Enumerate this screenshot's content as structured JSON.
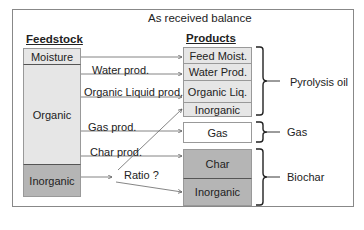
{
  "title": "As received balance",
  "feedstock": {
    "header": "Feedstock",
    "segments": [
      {
        "label": "Moisture",
        "shade": "light"
      },
      {
        "label": "Organic",
        "shade": "light"
      },
      {
        "label": "Inorganic",
        "shade": "dark"
      }
    ]
  },
  "products": {
    "header": "Products",
    "segments": [
      {
        "label": "Feed Moist.",
        "shade": "light"
      },
      {
        "label": "Water Prod.",
        "shade": "light"
      },
      {
        "label": "Organic Liq.",
        "shade": "light"
      },
      {
        "label": "Inorganic",
        "shade": "light"
      },
      {
        "label": "Gas",
        "shade": "white"
      },
      {
        "label": "Char",
        "shade": "dark"
      },
      {
        "label": "Inorganic",
        "shade": "dark"
      }
    ]
  },
  "flows": [
    {
      "label": "Water prod."
    },
    {
      "label": "Organic Liquid prod."
    },
    {
      "label": "Gas prod."
    },
    {
      "label": "Char prod."
    },
    {
      "label": "Ratio ?"
    }
  ],
  "groups": [
    {
      "label": "Pyrolysis oil"
    },
    {
      "label": "Gas"
    },
    {
      "label": "Biochar"
    }
  ],
  "colors": {
    "light": "#e6e6e6",
    "dark": "#b5b5b5",
    "line": "#555555"
  }
}
